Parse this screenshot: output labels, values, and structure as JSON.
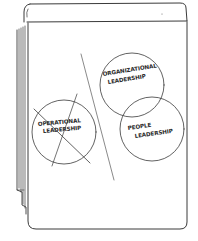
{
  "illustration": {
    "type": "hand-drawn flip chart sketch",
    "stroke_color": "#3a3a3a",
    "background_color": "#ffffff"
  },
  "flipchart": {
    "circles": [
      {
        "id": "operational",
        "line1": "OPERATIONAL",
        "line2": "LEADERSHIP",
        "crossed_out": true,
        "side": "left"
      },
      {
        "id": "organizational",
        "line1": "ORGANIZATIONAL",
        "line2": "LEADERSHIP",
        "crossed_out": false,
        "side": "right"
      },
      {
        "id": "people",
        "line1": "PEOPLE",
        "line2": "LEADERSHIP",
        "crossed_out": false,
        "side": "right"
      }
    ]
  }
}
